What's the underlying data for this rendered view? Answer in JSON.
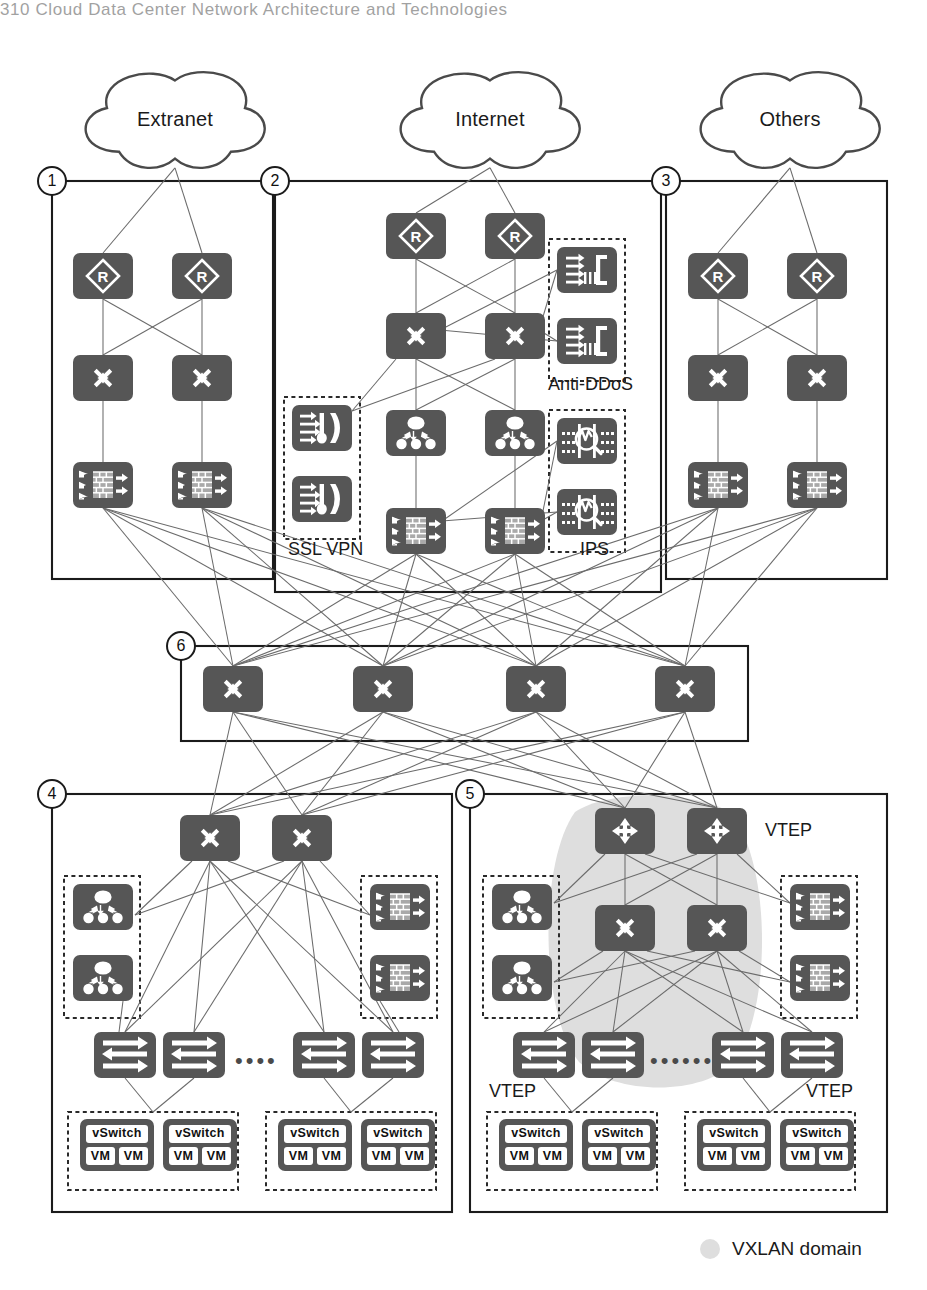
{
  "page": {
    "header_text": "310     Cloud Data Center Network Architecture and Technologies",
    "width": 927,
    "height": 1290
  },
  "colors": {
    "device_fill": "#565656",
    "line": "#6b6b6b",
    "zone_border": "#1b1b1b",
    "vxlan_shade": "#dedede",
    "chip_fill": "#ffffff"
  },
  "clouds": [
    {
      "id": "cloud-extranet",
      "label": "Extranet",
      "x": 75,
      "y": 62,
      "w": 200,
      "h": 115
    },
    {
      "id": "cloud-internet",
      "label": "Internet",
      "x": 390,
      "y": 62,
      "w": 200,
      "h": 115
    },
    {
      "id": "cloud-others",
      "label": "Others",
      "x": 690,
      "y": 62,
      "w": 200,
      "h": 115
    }
  ],
  "zones": [
    {
      "id": "zone-1",
      "number": "1",
      "x": 52,
      "y": 181,
      "w": 221,
      "h": 398
    },
    {
      "id": "zone-2",
      "number": "2",
      "x": 275,
      "y": 181,
      "w": 386,
      "h": 411
    },
    {
      "id": "zone-3",
      "number": "3",
      "x": 666,
      "y": 181,
      "w": 221,
      "h": 398
    },
    {
      "id": "zone-6",
      "number": "6",
      "x": 181,
      "y": 646,
      "w": 567,
      "h": 95
    },
    {
      "id": "zone-4",
      "number": "4",
      "x": 52,
      "y": 794,
      "w": 400,
      "h": 418
    },
    {
      "id": "zone-5",
      "number": "5",
      "x": 470,
      "y": 794,
      "w": 417,
      "h": 418
    }
  ],
  "device_groups": {
    "zone1": {
      "routers": [
        {
          "name": "router",
          "x": 73,
          "y": 253
        },
        {
          "name": "router",
          "x": 172,
          "y": 253
        }
      ],
      "switches": [
        {
          "name": "switch",
          "x": 73,
          "y": 355
        },
        {
          "name": "switch",
          "x": 172,
          "y": 355
        }
      ],
      "firewalls": [
        {
          "name": "firewall",
          "x": 73,
          "y": 462
        },
        {
          "name": "firewall",
          "x": 172,
          "y": 462
        }
      ]
    },
    "zone2": {
      "routers": [
        {
          "name": "router",
          "x": 386,
          "y": 213
        },
        {
          "name": "router",
          "x": 485,
          "y": 213
        }
      ],
      "switches": [
        {
          "name": "switch",
          "x": 386,
          "y": 313
        },
        {
          "name": "switch",
          "x": 485,
          "y": 313
        }
      ],
      "balancers": [
        {
          "name": "load-balancer",
          "x": 386,
          "y": 410
        },
        {
          "name": "load-balancer",
          "x": 485,
          "y": 410
        }
      ],
      "firewalls": [
        {
          "name": "firewall",
          "x": 386,
          "y": 508
        },
        {
          "name": "firewall",
          "x": 485,
          "y": 508
        }
      ],
      "antiddos": [
        {
          "name": "anti-ddos",
          "x": 557,
          "y": 247
        },
        {
          "name": "anti-ddos",
          "x": 557,
          "y": 318
        }
      ],
      "sslvpn": [
        {
          "name": "ssl-vpn",
          "x": 292,
          "y": 405
        },
        {
          "name": "ssl-vpn",
          "x": 292,
          "y": 476
        }
      ],
      "ips": [
        {
          "name": "ips",
          "x": 557,
          "y": 418
        },
        {
          "name": "ips",
          "x": 557,
          "y": 489
        }
      ]
    },
    "zone3": {
      "routers": [
        {
          "name": "router",
          "x": 688,
          "y": 253
        },
        {
          "name": "router",
          "x": 787,
          "y": 253
        }
      ],
      "switches": [
        {
          "name": "switch",
          "x": 688,
          "y": 355
        },
        {
          "name": "switch",
          "x": 787,
          "y": 355
        }
      ],
      "firewalls": [
        {
          "name": "firewall",
          "x": 688,
          "y": 462
        },
        {
          "name": "firewall",
          "x": 787,
          "y": 462
        }
      ]
    },
    "zone6": {
      "core_switches": [
        {
          "name": "core-switch",
          "x": 203,
          "y": 666
        },
        {
          "name": "core-switch",
          "x": 353,
          "y": 666
        },
        {
          "name": "core-switch",
          "x": 506,
          "y": 666
        },
        {
          "name": "core-switch",
          "x": 655,
          "y": 666
        }
      ]
    },
    "zone4": {
      "agg_switches": [
        {
          "name": "switch",
          "x": 180,
          "y": 815
        },
        {
          "name": "switch",
          "x": 272,
          "y": 815
        }
      ],
      "balancers": [
        {
          "name": "load-balancer",
          "x": 73,
          "y": 884
        },
        {
          "name": "load-balancer",
          "x": 73,
          "y": 955
        }
      ],
      "firewalls": [
        {
          "name": "firewall",
          "x": 370,
          "y": 884
        },
        {
          "name": "firewall",
          "x": 370,
          "y": 955
        }
      ],
      "tors": [
        {
          "name": "tor-switch",
          "x": 94,
          "y": 1032
        },
        {
          "name": "tor-switch",
          "x": 163,
          "y": 1032
        },
        {
          "name": "tor-switch",
          "x": 293,
          "y": 1032
        },
        {
          "name": "tor-switch",
          "x": 362,
          "y": 1032
        }
      ],
      "host_groups": [
        {
          "x": 68,
          "y": 1112,
          "w": 170,
          "h": 78,
          "hosts": [
            {
              "x": 80,
              "y": 1119
            },
            {
              "x": 163,
              "y": 1119
            }
          ]
        },
        {
          "x": 266,
          "y": 1112,
          "w": 170,
          "h": 78,
          "hosts": [
            {
              "x": 278,
              "y": 1119
            },
            {
              "x": 361,
              "y": 1119
            }
          ]
        }
      ]
    },
    "zone5": {
      "vtep_routers": [
        {
          "name": "vtep-router",
          "x": 595,
          "y": 808
        },
        {
          "name": "vtep-router",
          "x": 687,
          "y": 808
        }
      ],
      "switches": [
        {
          "name": "switch",
          "x": 595,
          "y": 905
        },
        {
          "name": "switch",
          "x": 687,
          "y": 905
        }
      ],
      "balancers": [
        {
          "name": "load-balancer",
          "x": 492,
          "y": 884
        },
        {
          "name": "load-balancer",
          "x": 492,
          "y": 955
        }
      ],
      "firewalls": [
        {
          "name": "firewall",
          "x": 790,
          "y": 884
        },
        {
          "name": "firewall",
          "x": 790,
          "y": 955
        }
      ],
      "tors": [
        {
          "name": "tor-switch",
          "x": 513,
          "y": 1032
        },
        {
          "name": "tor-switch",
          "x": 582,
          "y": 1032
        },
        {
          "name": "tor-switch",
          "x": 712,
          "y": 1032
        },
        {
          "name": "tor-switch",
          "x": 781,
          "y": 1032
        }
      ],
      "host_groups": [
        {
          "x": 487,
          "y": 1112,
          "w": 170,
          "h": 78,
          "hosts": [
            {
              "x": 499,
              "y": 1119
            },
            {
              "x": 582,
              "y": 1119
            }
          ]
        },
        {
          "x": 685,
          "y": 1112,
          "w": 170,
          "h": 78,
          "hosts": [
            {
              "x": 697,
              "y": 1119
            },
            {
              "x": 780,
              "y": 1119
            }
          ]
        }
      ]
    }
  },
  "dashed_groups": [
    {
      "id": "group-anti-ddos",
      "x": 549,
      "y": 239,
      "w": 76,
      "h": 142
    },
    {
      "id": "group-ssl-vpn",
      "x": 284,
      "y": 397,
      "w": 76,
      "h": 142
    },
    {
      "id": "group-ips",
      "x": 549,
      "y": 410,
      "w": 76,
      "h": 142
    },
    {
      "id": "group-z4-lb",
      "x": 64,
      "y": 876,
      "w": 76,
      "h": 142
    },
    {
      "id": "group-z4-fw",
      "x": 361,
      "y": 876,
      "w": 76,
      "h": 142
    },
    {
      "id": "group-z5-lb",
      "x": 483,
      "y": 876,
      "w": 76,
      "h": 142
    },
    {
      "id": "group-z5-fw",
      "x": 781,
      "y": 876,
      "w": 76,
      "h": 142
    }
  ],
  "labels": [
    {
      "id": "label-anti-ddos",
      "text": "Anti-DDoS",
      "x": 548,
      "y": 374
    },
    {
      "id": "label-ssl-vpn",
      "text": "SSL VPN",
      "x": 288,
      "y": 539
    },
    {
      "id": "label-ips",
      "text": "IPS",
      "x": 580,
      "y": 539
    },
    {
      "id": "label-vtep-top",
      "text": "VTEP",
      "x": 765,
      "y": 820
    },
    {
      "id": "label-vtep-left",
      "text": "VTEP",
      "x": 489,
      "y": 1081
    },
    {
      "id": "label-vtep-right",
      "text": "VTEP",
      "x": 806,
      "y": 1081
    }
  ],
  "ellipses": [
    {
      "id": "dots-zone4",
      "text": "••••",
      "x": 235,
      "y": 1050
    },
    {
      "id": "dots-zone5",
      "text": "••••••",
      "x": 650,
      "y": 1050
    }
  ],
  "vxlan_domain": {
    "shade_cx": 653,
    "shade_top": 812,
    "shade_bottom": 1072,
    "shade_left": 545,
    "shade_right": 762
  },
  "legend": {
    "x": 700,
    "y": 1238,
    "swatch_color": "#dedede",
    "text": "VXLAN domain"
  },
  "device_chip_text": {
    "vswitch": "vSwitch",
    "vm": "VM"
  },
  "icon_names": {
    "router": "router-icon",
    "switch": "switch-icon",
    "core-switch": "switch-icon",
    "firewall": "firewall-icon",
    "load-balancer": "load-balancer-icon",
    "anti-ddos": "anti-ddos-icon",
    "ssl-vpn": "ssl-vpn-icon",
    "ips": "ips-icon",
    "vtep-router": "vtep-router-icon",
    "tor-switch": "tor-switch-icon"
  }
}
